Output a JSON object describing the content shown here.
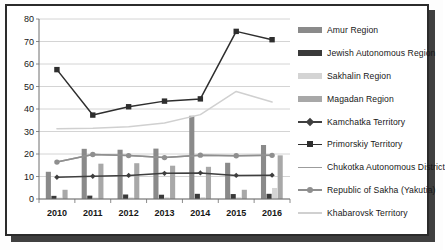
{
  "chart_data": {
    "type": "bar",
    "title": "",
    "subtitle": "",
    "xlabel": "",
    "ylabel": "",
    "ylim": [
      0,
      80
    ],
    "ytick_step": 10,
    "yticks": [
      "0",
      "10",
      "20",
      "30",
      "40",
      "50",
      "60",
      "70",
      "80"
    ],
    "grid": true,
    "grid_axis": "y",
    "legend_position": "right",
    "categories": [
      "2010",
      "2011",
      "2012",
      "2013",
      "2014",
      "2015",
      "2016"
    ],
    "bar_series": [
      {
        "name": "Amur Region",
        "kind": "bar",
        "color": "#8a8a8a",
        "values": [
          12.1,
          22.3,
          21.9,
          22.4,
          37.0,
          16.1,
          24.0
        ]
      },
      {
        "name": "Jewish Autonomous Region",
        "kind": "bar",
        "color": "#3a3a3a",
        "values": [
          1.4,
          1.5,
          2.0,
          1.9,
          2.3,
          2.2,
          2.3
        ]
      },
      {
        "name": "Sakhalin Region",
        "kind": "bar",
        "color": "#d4d4d4",
        "values": [
          0.6,
          0.6,
          0.7,
          0.7,
          0.8,
          0.7,
          4.9
        ]
      },
      {
        "name": "Magadan Region",
        "kind": "bar",
        "color": "#a8a8a8",
        "values": [
          4.1,
          15.7,
          15.9,
          14.8,
          14.3,
          4.1,
          19.4
        ]
      }
    ],
    "line_series": [
      {
        "name": "Kamchatka Territory",
        "kind": "line",
        "color": "#3f3f3f",
        "marker": "diamond",
        "values": [
          9.7,
          10.1,
          10.5,
          11.4,
          11.6,
          10.5,
          10.6
        ]
      },
      {
        "name": "Primorskiy Territory",
        "kind": "line",
        "color": "#2e2e2e",
        "marker": "square",
        "values": [
          57.5,
          37.3,
          41.0,
          43.5,
          44.5,
          74.5,
          70.8
        ]
      },
      {
        "name": "Chukotka Autonomous District",
        "kind": "line",
        "color": "#9c9c9c",
        "marker": "none",
        "values": [
          16.4,
          19.8,
          19.3,
          18.4,
          19.5,
          19.2,
          19.4
        ]
      },
      {
        "name": "Republic of Sakha (Yakutia)",
        "kind": "line",
        "color": "#8f8f8f",
        "marker": "circle",
        "values": [
          16.4,
          19.8,
          19.3,
          18.4,
          19.5,
          19.2,
          19.4
        ]
      },
      {
        "name": "Khabarovsk Territory",
        "kind": "line",
        "color": "#d0d0d0",
        "marker": "none",
        "values": [
          31.2,
          31.4,
          32.1,
          33.8,
          37.5,
          47.8,
          43.1
        ]
      }
    ],
    "legend": [
      {
        "label": "Amur Region",
        "key": "bar",
        "color": "#8a8a8a"
      },
      {
        "label": "Jewish Autonomous Region",
        "key": "bar",
        "color": "#3a3a3a"
      },
      {
        "label": "Sakhalin Region",
        "key": "bar",
        "color": "#d4d4d4"
      },
      {
        "label": "Magadan Region",
        "key": "bar",
        "color": "#a8a8a8"
      },
      {
        "label": "Kamchatka Territory",
        "key": "line-diamond",
        "color": "#3f3f3f"
      },
      {
        "label": "Primorskiy Territory",
        "key": "line-square",
        "color": "#2e2e2e"
      },
      {
        "label": "Chukotka Autonomous District",
        "key": "line-plain",
        "color": "#9c9c9c"
      },
      {
        "label": "Republic of Sakha (Yakutia)",
        "key": "line-circle",
        "color": "#8f8f8f"
      },
      {
        "label": "Khabarovsk Territory",
        "key": "line-plain-light",
        "color": "#d0d0d0"
      }
    ]
  },
  "colors": {
    "frame": "#2b2b2b",
    "grid": "#c9c9c9",
    "axis": "#6e6e6e",
    "text": "#171717",
    "background": "#ffffff"
  }
}
